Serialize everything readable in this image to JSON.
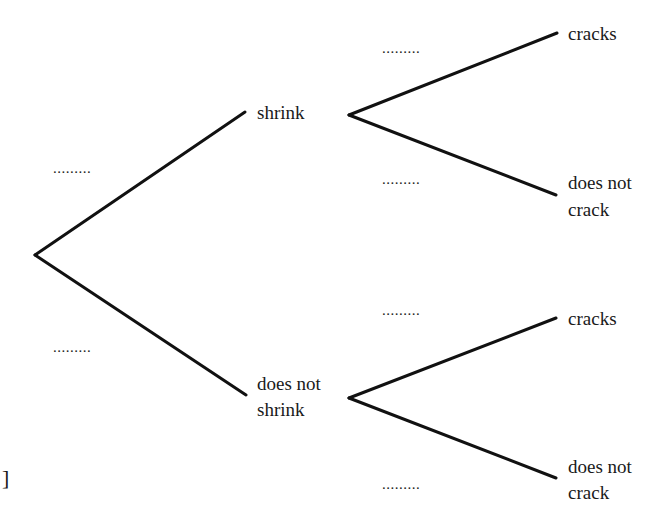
{
  "diagram": {
    "type": "probability-tree",
    "stroke_color": "#111111",
    "first_stage": {
      "branches": [
        {
          "label": "shrink",
          "probability_blank": "........."
        },
        {
          "label_line1": "does not",
          "label_line2": "shrink",
          "probability_blank": "........."
        }
      ]
    },
    "second_stage": {
      "upper": [
        {
          "label": "cracks",
          "probability_blank": "........."
        },
        {
          "label_line1": "does not",
          "label_line2": "crack",
          "probability_blank": "........."
        }
      ],
      "lower": [
        {
          "label": "cracks",
          "probability_blank": "........."
        },
        {
          "label_line1": "does not",
          "label_line2": "crack",
          "probability_blank": "........."
        }
      ]
    },
    "margin_mark": "]"
  }
}
